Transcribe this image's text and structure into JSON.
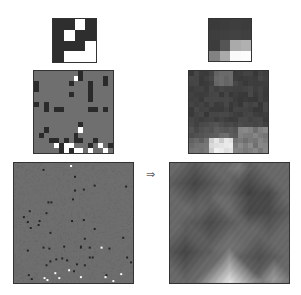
{
  "figure": {
    "arrow_symbol": "⇒",
    "rows": [
      {
        "name": "small",
        "left": {
          "size": 4,
          "background": "#2e2e2e",
          "cells": [
            [
              "D",
              "D",
              "W",
              "D"
            ],
            [
              "D",
              "W",
              "D",
              "D"
            ],
            [
              "D",
              "D",
              "D",
              "W"
            ],
            [
              "D",
              "W",
              "W",
              "W"
            ]
          ]
        },
        "right": {
          "size": 4,
          "values": [
            [
              58,
              60,
              62,
              60
            ],
            [
              62,
              64,
              66,
              64
            ],
            [
              60,
              85,
              170,
              176
            ],
            [
              130,
              170,
              250,
              252
            ]
          ]
        }
      },
      {
        "name": "medium",
        "left": {
          "size": 16,
          "background": "#6f6f6f",
          "dark_cells": [
            [
              0,
              9
            ],
            [
              1,
              9
            ],
            [
              1,
              14
            ],
            [
              2,
              0
            ],
            [
              2,
              7
            ],
            [
              2,
              11
            ],
            [
              2,
              14
            ],
            [
              3,
              0
            ],
            [
              3,
              11
            ],
            [
              4,
              7
            ],
            [
              4,
              11
            ],
            [
              5,
              11
            ],
            [
              6,
              0
            ],
            [
              6,
              2
            ],
            [
              7,
              2
            ],
            [
              7,
              4
            ],
            [
              7,
              5
            ],
            [
              7,
              11
            ],
            [
              7,
              12
            ],
            [
              7,
              14
            ],
            [
              10,
              9
            ],
            [
              11,
              2
            ],
            [
              12,
              1
            ],
            [
              12,
              8
            ],
            [
              13,
              3
            ],
            [
              13,
              4
            ],
            [
              13,
              6
            ],
            [
              13,
              8
            ],
            [
              13,
              9
            ],
            [
              13,
              12
            ],
            [
              14,
              5
            ],
            [
              14,
              7
            ],
            [
              14,
              11
            ],
            [
              14,
              15
            ],
            [
              15,
              5
            ],
            [
              15,
              7
            ]
          ],
          "white_cells": [
            [
              1,
              8
            ],
            [
              11,
              9
            ],
            [
              14,
              4
            ],
            [
              14,
              6
            ],
            [
              14,
              7
            ],
            [
              14,
              13
            ],
            [
              15,
              6
            ],
            [
              15,
              8
            ],
            [
              15,
              9
            ],
            [
              15,
              11
            ],
            [
              15,
              14
            ]
          ]
        },
        "right": {
          "size": 16,
          "description": "blurred grayscale field, dark top-left to right, light region bottom-center"
        }
      },
      {
        "name": "large",
        "left": {
          "size": 121,
          "background": "#6e6e6e",
          "description": "gray field with sparse dark and white specks, denser near bottom"
        },
        "right": {
          "size": 121,
          "description": "smoothed mottled grayscale field with bright patch at bottom-center"
        }
      }
    ]
  }
}
